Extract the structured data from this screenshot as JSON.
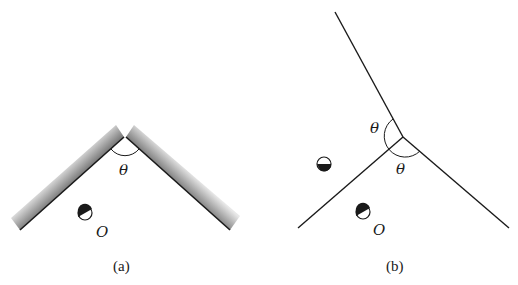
{
  "figure": {
    "panels": [
      {
        "id": "a",
        "caption": "(a)",
        "angle_label": "θ",
        "object_label": "O",
        "mirror_style": "shaded-bars",
        "description": "Two plane mirrors meeting at angle θ with object O between them"
      },
      {
        "id": "b",
        "caption": "(b)",
        "angle_labels": [
          "θ",
          "θ"
        ],
        "object_label": "O",
        "mirror_style": "lines",
        "description": "Angular regions of size θ formed by mirror and its extension, showing object O and its image"
      }
    ],
    "colors": {
      "line": "#1a1a1a",
      "mirror_shade_dark": "#8a8a8a",
      "mirror_shade_light": "#e6e6e6",
      "background": "#ffffff"
    }
  }
}
